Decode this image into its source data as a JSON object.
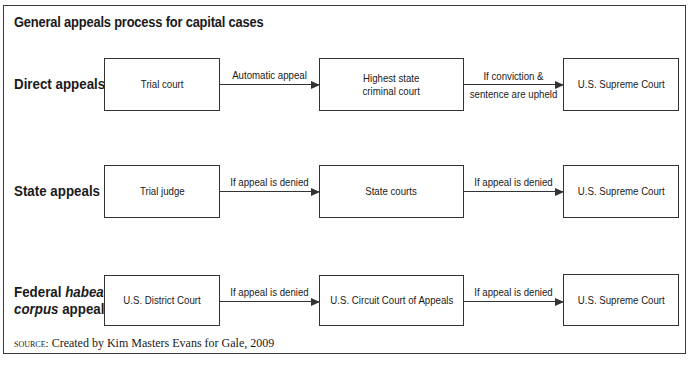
{
  "title": "General appeals process for capital cases",
  "rows": [
    {
      "label": "Direct appeals",
      "boxes": [
        "Trial court",
        "Highest state criminal court",
        "U.S. Supreme Court"
      ],
      "arrows": [
        "Automatic appeal",
        "If conviction & sentence are upheld"
      ]
    },
    {
      "label": "State appeals",
      "boxes": [
        "Trial judge",
        "State courts",
        "U.S. Supreme Court"
      ],
      "arrows": [
        "If appeal is denied",
        "If appeal is denied"
      ]
    },
    {
      "label_parts": [
        "Federal ",
        "habeas",
        " ",
        "corpus",
        " appeals"
      ],
      "boxes": [
        "U.S. District Court",
        "U.S. Circuit Court of Appeals",
        "U.S. Supreme Court"
      ],
      "arrows": [
        "If appeal is denied",
        "If appeal is denied"
      ]
    }
  ],
  "row2_box2_lines": [
    "Highest state",
    "criminal court"
  ],
  "row1_arrow2_lines": [
    "If conviction &",
    "sentence are upheld"
  ],
  "source": {
    "prefix": "source:",
    "text": " Created by Kim Masters Evans for Gale, 2009"
  }
}
